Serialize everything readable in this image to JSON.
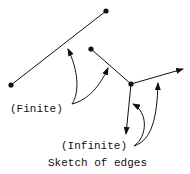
{
  "diagram": {
    "title": "Sketch of edges",
    "labels": {
      "finite": "(Finite)",
      "infinite": "(Infinite)"
    },
    "nodes": [
      {
        "id": "a",
        "x": 106,
        "y": 11
      },
      {
        "id": "b",
        "x": 11,
        "y": 85
      },
      {
        "id": "c",
        "x": 91,
        "y": 49
      },
      {
        "id": "d",
        "x": 131,
        "y": 84
      }
    ],
    "edges": [
      {
        "from": "a",
        "to": "b",
        "type": "finite"
      },
      {
        "from": "c",
        "to": "d",
        "type": "finite"
      },
      {
        "from": "d",
        "to": [
          183,
          69
        ],
        "type": "infinite"
      },
      {
        "from": "d",
        "to": [
          126,
          134
        ],
        "type": "infinite"
      }
    ],
    "color": "#111111"
  }
}
